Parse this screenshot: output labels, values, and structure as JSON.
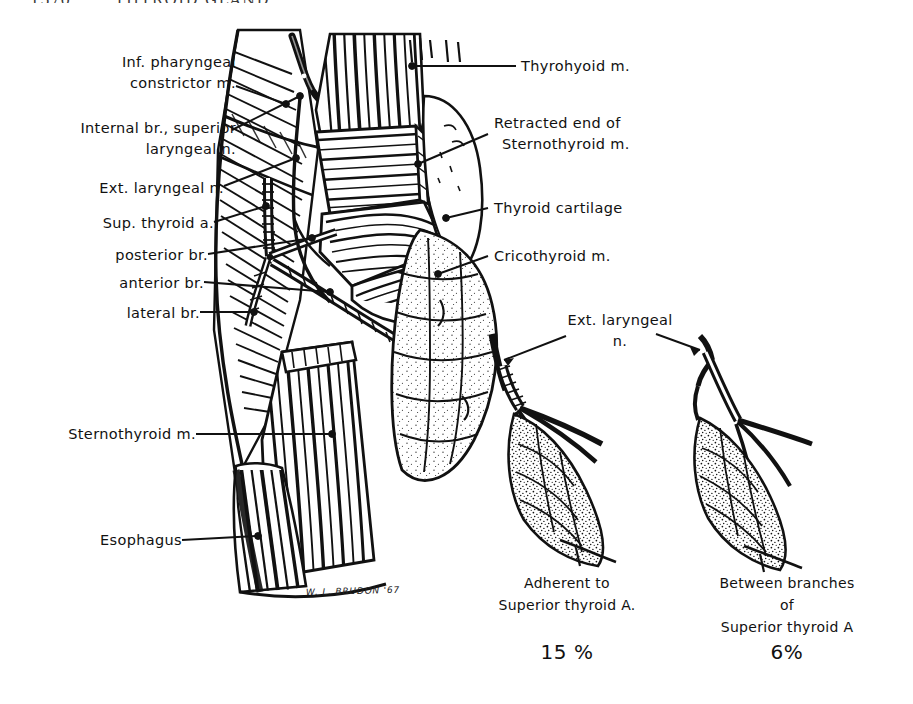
{
  "running_head": {
    "folio": "1570",
    "title": "THYROID GLAND"
  },
  "plate": {
    "signature": "W. L. BRUDON '67"
  },
  "labels_left": [
    {
      "id": "inf-pharyngeal-constrictor",
      "lines": [
        "Inf. pharyngeal",
        "constrictor m."
      ]
    },
    {
      "id": "internal-br-superior-laryngeal-n",
      "lines": [
        "Internal br., superior",
        "laryngeal n."
      ]
    },
    {
      "id": "ext-laryngeal-n",
      "lines": [
        "Ext. laryngeal n."
      ]
    },
    {
      "id": "sup-thyroid-a",
      "lines": [
        "Sup. thyroid a."
      ]
    },
    {
      "id": "posterior-br",
      "lines": [
        "posterior br."
      ]
    },
    {
      "id": "anterior-br",
      "lines": [
        "anterior br."
      ]
    },
    {
      "id": "lateral-br",
      "lines": [
        "lateral br."
      ]
    },
    {
      "id": "sternothyroid-m",
      "lines": [
        "Sternothyroid m."
      ]
    },
    {
      "id": "esophagus",
      "lines": [
        "Esophagus"
      ]
    }
  ],
  "labels_right": [
    {
      "id": "thyrohyoid-m",
      "lines": [
        "Thyrohyoid  m."
      ]
    },
    {
      "id": "retracted-end-sternothyroid",
      "lines": [
        "Retracted  end  of",
        "Sternothyroid m."
      ]
    },
    {
      "id": "thyroid-cartilage",
      "lines": [
        "Thyroid  cartilage"
      ]
    },
    {
      "id": "cricothyroid-m",
      "lines": [
        "Cricothyroid  m."
      ]
    }
  ],
  "insets": {
    "shared_label": {
      "id": "ext-laryngeal-n-inset",
      "lines": [
        "Ext. laryngeal",
        "n."
      ]
    },
    "items": [
      {
        "id": "inset-adherent",
        "caption_lines": [
          "Adherent to",
          "Superior thyroid A."
        ],
        "percent": "15 %"
      },
      {
        "id": "inset-between-branches",
        "caption_lines": [
          "Between  branches",
          "of",
          "Superior thyroid  A"
        ],
        "percent": "6%"
      }
    ]
  },
  "colors": {
    "ink": "#111111",
    "paper": "#ffffff",
    "runhead": "#3a3a3a"
  }
}
